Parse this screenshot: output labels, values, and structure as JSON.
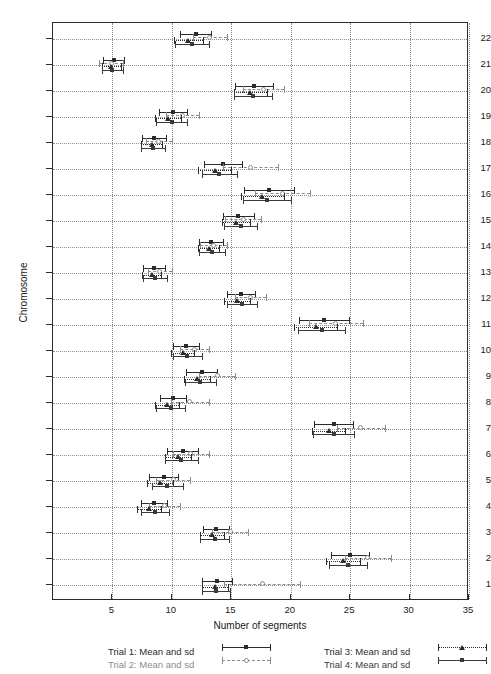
{
  "chart_data": {
    "type": "scatter",
    "title": "",
    "xlabel": "Number of segments",
    "ylabel": "Chromosome",
    "xlim": [
      0,
      35
    ],
    "ylim": [
      0.4,
      22.6
    ],
    "xticks": [
      5,
      10,
      15,
      20,
      25,
      30,
      35
    ],
    "yticks": [
      1,
      2,
      3,
      4,
      5,
      6,
      7,
      8,
      9,
      10,
      11,
      12,
      13,
      14,
      15,
      16,
      17,
      18,
      19,
      20,
      21,
      22
    ],
    "grid": true,
    "orientation": "horizontal",
    "legend_position": "bottom",
    "categories": [
      22,
      21,
      20,
      19,
      18,
      17,
      16,
      15,
      14,
      13,
      12,
      11,
      10,
      9,
      8,
      7,
      6,
      5,
      4,
      3,
      2,
      1
    ],
    "series": [
      {
        "name": "Trial 1: Mean and sd",
        "marker": "filled-square",
        "line": "solid",
        "color": "#2b2b2b",
        "row_offset": 0.18,
        "means": [
          12.0,
          5.1,
          16.9,
          10.1,
          8.5,
          14.3,
          18.2,
          15.6,
          13.3,
          8.5,
          15.8,
          22.8,
          11.2,
          12.5,
          10.1,
          23.6,
          10.9,
          9.3,
          8.5,
          13.7,
          25.0,
          13.8
        ],
        "sd": [
          1.3,
          0.9,
          1.6,
          1.2,
          1.0,
          1.6,
          2.1,
          1.3,
          1.0,
          0.9,
          1.2,
          2.1,
          1.1,
          1.3,
          1.1,
          1.6,
          1.3,
          1.2,
          1.1,
          1.1,
          1.6,
          1.3
        ]
      },
      {
        "name": "Trial 2: Mean and sd",
        "marker": "open-circle",
        "line": "dashed",
        "color": "#8c8c8c",
        "row_offset": 0.06,
        "means": [
          13.2,
          4.9,
          17.7,
          10.9,
          8.9,
          16.6,
          19.3,
          16.0,
          13.5,
          9.0,
          16.6,
          23.8,
          11.9,
          13.8,
          11.5,
          25.9,
          11.6,
          10.1,
          9.4,
          14.9,
          26.5,
          17.6
        ],
        "sd": [
          1.4,
          1.0,
          1.7,
          1.4,
          1.1,
          2.3,
          2.3,
          1.5,
          1.1,
          1.0,
          1.3,
          2.3,
          1.2,
          1.5,
          1.6,
          2.0,
          1.5,
          1.4,
          1.3,
          1.5,
          1.9,
          3.2
        ]
      },
      {
        "name": "Trial 3: Mean and sd",
        "marker": "filled-triangle",
        "line": "dotted",
        "color": "#2b2b2b",
        "row_offset": -0.06,
        "means": [
          11.4,
          4.9,
          16.6,
          9.7,
          8.3,
          13.6,
          17.6,
          15.4,
          13.1,
          8.3,
          15.5,
          22.1,
          10.9,
          12.1,
          9.6,
          23.2,
          10.5,
          9.0,
          8.1,
          13.4,
          24.4,
          13.6
        ],
        "sd": [
          1.2,
          0.8,
          1.4,
          1.1,
          0.9,
          1.4,
          1.8,
          1.2,
          0.9,
          0.8,
          1.1,
          1.8,
          1.0,
          1.1,
          1.0,
          1.4,
          1.1,
          1.1,
          1.0,
          1.0,
          1.4,
          1.1
        ]
      },
      {
        "name": "Trial 4: Mean and sd",
        "marker": "filled-square",
        "line": "solid",
        "color": "#3a3a3a",
        "row_offset": -0.2,
        "means": [
          11.7,
          5.0,
          16.8,
          10.0,
          8.4,
          14.0,
          18.0,
          15.8,
          13.4,
          8.6,
          15.9,
          22.6,
          11.3,
          12.4,
          9.9,
          23.6,
          10.8,
          9.6,
          8.6,
          13.6,
          24.8,
          13.7
        ],
        "sd": [
          1.4,
          0.9,
          1.6,
          1.3,
          1.0,
          1.5,
          2.0,
          1.4,
          1.1,
          1.0,
          1.3,
          2.0,
          1.2,
          1.3,
          1.2,
          1.7,
          1.4,
          1.3,
          1.2,
          1.2,
          1.6,
          1.2
        ]
      }
    ]
  },
  "axes": {
    "xlabel": "Number of segments",
    "ylabel": "Chromosome"
  },
  "legend": {
    "entries": [
      {
        "label": "Trial 1: Mean and sd",
        "column": "left"
      },
      {
        "label": "Trial 2: Mean and sd",
        "column": "left"
      },
      {
        "label": "Trial 3: Mean and sd",
        "column": "right"
      },
      {
        "label": "Trial 4: Mean and sd",
        "column": "right"
      }
    ]
  }
}
